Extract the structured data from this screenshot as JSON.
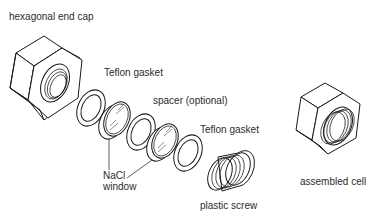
{
  "diagram": {
    "labels": {
      "end_cap": "hexagonal end cap",
      "gasket_1": "Teflon gasket",
      "spacer": "spacer (optional)",
      "gasket_2": "Teflon gasket",
      "window_line1": "NaCl",
      "window_line2": "window",
      "screw": "plastic screw",
      "assembled": "assembled cell"
    },
    "components": [
      {
        "name": "hexagonal end cap",
        "type": "hex-nut"
      },
      {
        "name": "Teflon gasket",
        "type": "ring"
      },
      {
        "name": "NaCl window",
        "type": "disc"
      },
      {
        "name": "spacer (optional)",
        "type": "ring"
      },
      {
        "name": "NaCl window",
        "type": "disc"
      },
      {
        "name": "Teflon gasket",
        "type": "ring"
      },
      {
        "name": "plastic screw",
        "type": "threaded-cylinder"
      },
      {
        "name": "assembled cell",
        "type": "hex-nut-with-screw"
      }
    ],
    "colors": {
      "stroke": "#1a1a1a",
      "text": "#2b2b2b",
      "background": "#ffffff"
    }
  }
}
